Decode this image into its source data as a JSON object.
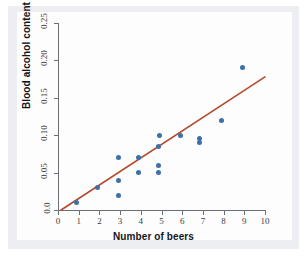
{
  "chart_data": {
    "type": "scatter",
    "title": "",
    "xlabel": "Number of beers",
    "ylabel": "Blood alcohol content",
    "xlim": [
      0,
      10
    ],
    "ylim": [
      0.0,
      0.25
    ],
    "grid": false,
    "legend": null,
    "xticks": [
      "0",
      "1",
      "2",
      "3",
      "4",
      "5",
      "6",
      "7",
      "8",
      "9",
      "10"
    ],
    "xtick_values": [
      0,
      1,
      2,
      3,
      4,
      5,
      6,
      7,
      8,
      9,
      10
    ],
    "yticks": [
      "0.0",
      "0.05",
      "0.10",
      "0.15",
      "0.20",
      "0.25"
    ],
    "ytick_values": [
      0.0,
      0.05,
      0.1,
      0.15,
      0.2,
      0.25
    ],
    "point_color": "#3d6fa8",
    "line_color": "#b34a2c",
    "points": [
      {
        "x": 0.9,
        "y": 0.01
      },
      {
        "x": 1.9,
        "y": 0.03
      },
      {
        "x": 2.9,
        "y": 0.02
      },
      {
        "x": 2.9,
        "y": 0.04
      },
      {
        "x": 2.9,
        "y": 0.07
      },
      {
        "x": 3.9,
        "y": 0.05
      },
      {
        "x": 3.9,
        "y": 0.07
      },
      {
        "x": 4.85,
        "y": 0.05
      },
      {
        "x": 4.85,
        "y": 0.06
      },
      {
        "x": 4.85,
        "y": 0.085
      },
      {
        "x": 4.9,
        "y": 0.1
      },
      {
        "x": 5.9,
        "y": 0.1
      },
      {
        "x": 6.85,
        "y": 0.09
      },
      {
        "x": 6.85,
        "y": 0.095
      },
      {
        "x": 7.9,
        "y": 0.12
      },
      {
        "x": 8.9,
        "y": 0.19
      }
    ],
    "fit_line": {
      "type": "linear-regression",
      "x_start": 0.15,
      "y_start": 0.0,
      "x_end": 10.0,
      "y_end": 0.178
    }
  }
}
